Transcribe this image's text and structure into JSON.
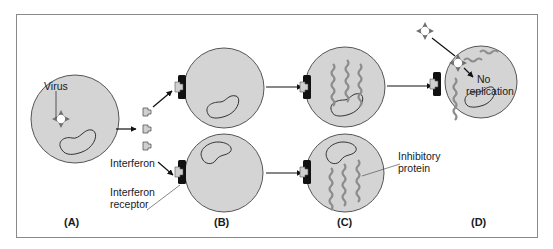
{
  "figure": {
    "panels": [
      {
        "id": "A",
        "label": "(A)"
      },
      {
        "id": "B",
        "label": "(B)"
      },
      {
        "id": "C",
        "label": "(C)"
      },
      {
        "id": "D",
        "label": "(D)"
      }
    ],
    "annotations": {
      "virus": "Virus",
      "interferon": "Interferon",
      "interferon_receptor_line1": "Interferon",
      "interferon_receptor_line2": "receptor",
      "inhibitory_protein_line1": "Inhibitory",
      "inhibitory_protein_line2": "protein",
      "no_replication_line1": "No",
      "no_replication_line2": "replication"
    },
    "colors": {
      "cell_fill": "#d4d4d4",
      "cell_stroke": "#555555",
      "receptor": "#111111",
      "interferon_fill": "#cfcfcf",
      "protein_wave": "#8c8c8c",
      "frame_border": "#8a8a8a"
    }
  }
}
